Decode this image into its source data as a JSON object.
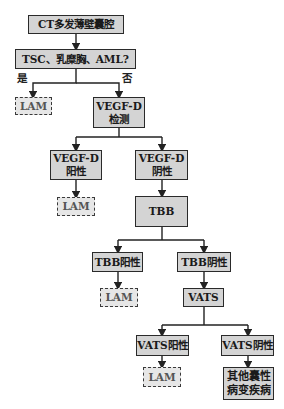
{
  "diagram": {
    "type": "flowchart",
    "nodes": {
      "ct": {
        "line1": "CT多发薄壁囊腔"
      },
      "q": {
        "line1": "TSC、乳糜胸、AML?"
      },
      "lam1": {
        "line1": "LAM"
      },
      "vegf": {
        "line1": "VEGF-D",
        "line2": "检测"
      },
      "vegf_pos": {
        "line1": "VEGF-D",
        "line2": "阳性"
      },
      "vegf_neg": {
        "line1": "VEGF-D",
        "line2": "阴性"
      },
      "lam2": {
        "line1": "LAM"
      },
      "tbb": {
        "line1": "TBB"
      },
      "tbb_pos": {
        "line1": "TBB阳性"
      },
      "tbb_neg": {
        "line1": "TBB阴性"
      },
      "lam3": {
        "line1": "LAM"
      },
      "vats": {
        "line1": "VATS"
      },
      "vats_pos": {
        "line1": "VATS阳性"
      },
      "vats_neg": {
        "line1": "VATS阴性"
      },
      "lam4": {
        "line1": "LAM"
      },
      "other": {
        "line1": "其他囊性",
        "line2": "病变疾病"
      }
    },
    "edge_labels": {
      "yes": "是",
      "no": "否"
    }
  }
}
